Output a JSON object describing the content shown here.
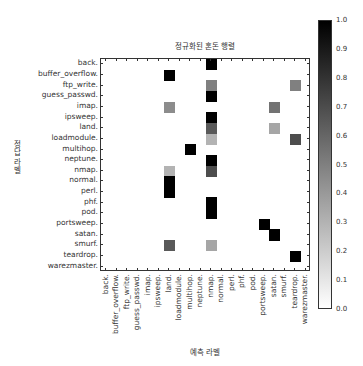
{
  "chart_data": {
    "type": "heatmap",
    "title": "정규화된 혼돈 행렬",
    "xlabel": "예측 라벨",
    "ylabel": "정답 라벨",
    "rows": [
      "back.",
      "buffer_overflow.",
      "ftp_write.",
      "guess_passwd.",
      "imap.",
      "ipsweep.",
      "land.",
      "loadmodule.",
      "multihop.",
      "neptune.",
      "nmap.",
      "normal.",
      "perl.",
      "phf.",
      "pod.",
      "portsweep.",
      "satan.",
      "smurf.",
      "teardrop.",
      "warezmaster."
    ],
    "columns": [
      "back.",
      "buffer_overflow.",
      "ftp_write.",
      "guess_passwd.",
      "imap.",
      "ipsweep.",
      "land.",
      "loadmodule.",
      "multihop.",
      "neptune.",
      "nmap.",
      "normal.",
      "perl.",
      "phf.",
      "pod.",
      "portsweep.",
      "satan.",
      "smurf.",
      "teardrop.",
      "warezmaster."
    ],
    "cells": [
      {
        "row": 0,
        "col": 10,
        "value": 1.0
      },
      {
        "row": 1,
        "col": 6,
        "value": 1.0
      },
      {
        "row": 2,
        "col": 10,
        "value": 0.5
      },
      {
        "row": 2,
        "col": 18,
        "value": 0.5
      },
      {
        "row": 3,
        "col": 10,
        "value": 1.0
      },
      {
        "row": 4,
        "col": 6,
        "value": 0.45
      },
      {
        "row": 4,
        "col": 16,
        "value": 0.55
      },
      {
        "row": 5,
        "col": 10,
        "value": 1.0
      },
      {
        "row": 6,
        "col": 10,
        "value": 0.65
      },
      {
        "row": 6,
        "col": 16,
        "value": 0.35
      },
      {
        "row": 7,
        "col": 10,
        "value": 0.3
      },
      {
        "row": 7,
        "col": 18,
        "value": 0.7
      },
      {
        "row": 8,
        "col": 8,
        "value": 1.0
      },
      {
        "row": 9,
        "col": 10,
        "value": 1.0
      },
      {
        "row": 10,
        "col": 6,
        "value": 0.3
      },
      {
        "row": 10,
        "col": 10,
        "value": 0.7
      },
      {
        "row": 11,
        "col": 6,
        "value": 1.0
      },
      {
        "row": 12,
        "col": 6,
        "value": 1.0
      },
      {
        "row": 13,
        "col": 10,
        "value": 1.0
      },
      {
        "row": 14,
        "col": 10,
        "value": 1.0
      },
      {
        "row": 15,
        "col": 15,
        "value": 1.0
      },
      {
        "row": 16,
        "col": 16,
        "value": 1.0
      },
      {
        "row": 17,
        "col": 6,
        "value": 0.65
      },
      {
        "row": 17,
        "col": 10,
        "value": 0.35
      },
      {
        "row": 18,
        "col": 18,
        "value": 1.0
      }
    ],
    "colorbar": {
      "min": 0.0,
      "max": 1.0,
      "ticks": [
        "1.0",
        "0.9",
        "0.8",
        "0.7",
        "0.6",
        "0.5",
        "0.4",
        "0.3",
        "0.2",
        "0.1",
        "0.0"
      ],
      "colormap": "Greys"
    },
    "grid": false
  }
}
